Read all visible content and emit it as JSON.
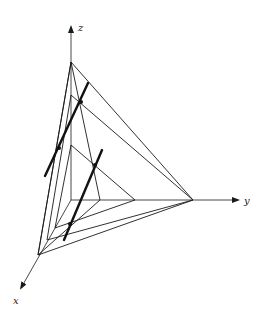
{
  "figure": {
    "type": "3d-coordinate-diagram",
    "colors": {
      "ink": "#1a1a1a",
      "background": "#ffffff"
    }
  },
  "axes": {
    "x": {
      "label": "x"
    },
    "y": {
      "label": "y"
    },
    "z": {
      "label": "z"
    }
  },
  "geometry": {
    "origin": [
      71,
      200
    ],
    "axis_ends": {
      "z": [
        71,
        25
      ],
      "y": [
        240,
        200
      ],
      "x": [
        20,
        290
      ]
    },
    "triangles": [
      {
        "name": "outer-plane",
        "z": [
          71,
          62
        ],
        "y": [
          193,
          200
        ],
        "x": [
          38,
          255
        ]
      },
      {
        "name": "middle-plane",
        "z": [
          71,
          95
        ],
        "y": [
          193,
          200
        ],
        "x": [
          47,
          240
        ]
      },
      {
        "name": "steep-plane",
        "z": [
          71,
          62
        ],
        "y": [
          100,
          200
        ],
        "x": [
          38,
          255
        ]
      },
      {
        "name": "inner-plane",
        "z": [
          71,
          145
        ],
        "y": [
          135,
          200
        ],
        "x": [
          55,
          228
        ]
      }
    ],
    "bold_lines": [
      {
        "name": "line-1",
        "from": [
          45,
          176
        ],
        "to": [
          88,
          83
        ],
        "points": [
          [
            59,
            148
          ],
          [
            81,
            102
          ]
        ]
      },
      {
        "name": "line-2",
        "from": [
          64,
          240
        ],
        "to": [
          102,
          150
        ],
        "points": [
          [
            70,
            224
          ],
          [
            95,
            165
          ]
        ]
      }
    ]
  }
}
